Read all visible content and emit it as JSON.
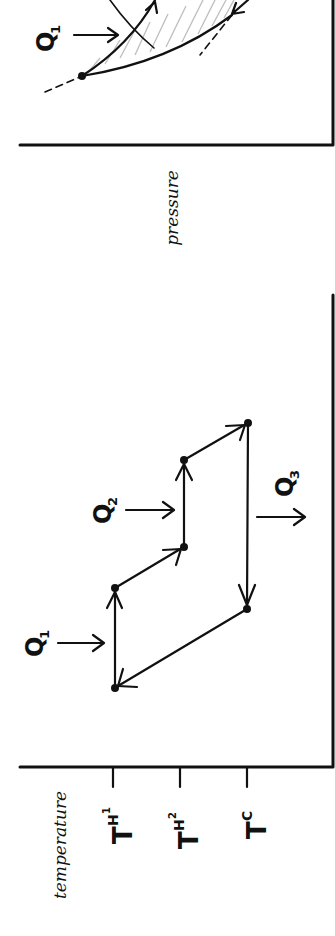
{
  "figure": {
    "orientation": "rotated 90 degrees clockwise",
    "ink_color": "#111111",
    "hatch_color": "#bdbdbd",
    "background": "#ffffff"
  },
  "top_plot": {
    "x_axis_label": "pressure",
    "heat_labels": [
      {
        "letter": "Q",
        "subscript": "1"
      }
    ],
    "description": "Partially visible pressure plot with two curves enclosing a hatched region, arrows on curves, dashed extensions"
  },
  "bottom_plot": {
    "x_axis_label": "temperature",
    "ticks": [
      {
        "letter": "T",
        "subscript": "H",
        "sub_subscript": "1"
      },
      {
        "letter": "T",
        "subscript": "H",
        "sub_subscript": "2"
      },
      {
        "letter": "T",
        "subscript": "C",
        "sub_subscript": ""
      }
    ],
    "heat_labels": [
      {
        "letter": "Q",
        "subscript": "1",
        "direction": "in"
      },
      {
        "letter": "Q",
        "subscript": "2",
        "direction": "in"
      },
      {
        "letter": "Q",
        "subscript": "3",
        "direction": "out"
      }
    ],
    "cycle_points": [
      {
        "name": "A",
        "temperature": "T_H1",
        "level": "low"
      },
      {
        "name": "B",
        "temperature": "T_H1",
        "level": "mid-low"
      },
      {
        "name": "C",
        "temperature": "T_H2",
        "level": "mid"
      },
      {
        "name": "D",
        "temperature": "T_H2",
        "level": "mid-high"
      },
      {
        "name": "E",
        "temperature": "T_C",
        "level": "high"
      },
      {
        "name": "F",
        "temperature": "T_C",
        "level": "mid-low"
      }
    ]
  }
}
